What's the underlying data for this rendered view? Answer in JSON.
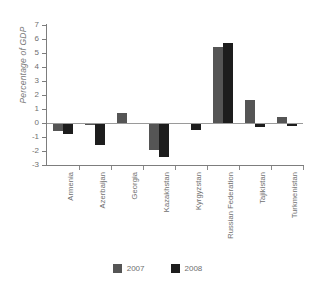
{
  "chart_data": {
    "type": "bar",
    "title": "",
    "xlabel": "",
    "ylabel": "Percentage of GDP",
    "ylim": [
      -3,
      7
    ],
    "yticks": [
      7,
      6,
      5,
      4,
      3,
      2,
      1,
      0,
      -1,
      -2,
      -3
    ],
    "grid": false,
    "legend_position": "bottom",
    "categories": [
      "Armenia",
      "Azerbaijan",
      "Georgia",
      "Kazakhstan",
      "Kyrgyzstan",
      "Russian Federation",
      "Tajikistan",
      "Turkmenistan"
    ],
    "series": [
      {
        "name": "2007",
        "color": "#555555",
        "values": [
          -0.6,
          -0.15,
          0.75,
          -1.9,
          -0.05,
          5.4,
          1.65,
          0.4
        ]
      },
      {
        "name": "2008",
        "color": "#1d1d1d",
        "values": [
          -0.8,
          -1.6,
          0.0,
          -2.4,
          -0.5,
          5.7,
          -0.3,
          -0.2
        ]
      }
    ]
  },
  "legend": {
    "items": [
      {
        "label": "2007",
        "color": "#555555"
      },
      {
        "label": "2008",
        "color": "#1d1d1d"
      }
    ]
  }
}
